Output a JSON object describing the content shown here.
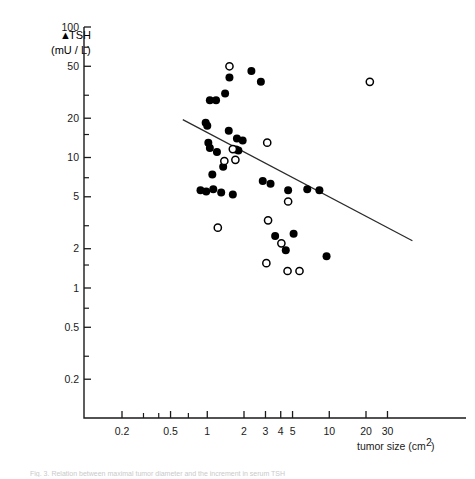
{
  "figure": {
    "caption": "Fig. 3. Relation between maximal tumor diameter and the increment in serum TSH",
    "x_axis_title": "tumor size (cm",
    "x_axis_title_sup": "2",
    "x_axis_title_end": ")",
    "y_axis_label_line1": "TSH",
    "y_axis_label_delta": "▲",
    "y_axis_label_line2": "(mU / L)"
  },
  "chart_data": {
    "type": "scatter",
    "title": "",
    "xlabel": "tumor size (cm2)",
    "ylabel": "ΔTSH (mU/L)",
    "xscale": "log",
    "yscale": "log",
    "xlim": [
      0.13,
      48
    ],
    "ylim": [
      0.16,
      100
    ],
    "grid": false,
    "legend": "none",
    "xticks": [
      0.2,
      0.5,
      1,
      2,
      3,
      4,
      5,
      10,
      20,
      30
    ],
    "xtick_labels": [
      "0.2",
      "0.5",
      "1",
      "2",
      "3",
      "4",
      "5",
      "10",
      "20",
      "30"
    ],
    "xticks_minor": [
      0.3,
      0.4,
      0.7
    ],
    "yticks": [
      0.2,
      0.5,
      1,
      2,
      5,
      10,
      20,
      50,
      100
    ],
    "ytick_labels": [
      "0.2",
      "0.5",
      "1",
      "2",
      "5",
      "10",
      "20",
      "50",
      "100"
    ],
    "yticks_minor": [
      0.3,
      0.7,
      1.5,
      3,
      7,
      15,
      30,
      70
    ],
    "series": [
      {
        "name": "filled",
        "marker": "filled-circle",
        "color": "#000000",
        "points": [
          [
            1.52,
            41.0
          ],
          [
            2.3,
            46.0
          ],
          [
            2.75,
            38.0
          ],
          [
            1.05,
            27.5
          ],
          [
            1.18,
            27.5
          ],
          [
            1.4,
            31.0
          ],
          [
            1.5,
            16.0
          ],
          [
            1.75,
            14.0
          ],
          [
            1.95,
            13.5
          ],
          [
            0.97,
            18.5
          ],
          [
            1.0,
            17.5
          ],
          [
            1.02,
            13.0
          ],
          [
            1.05,
            11.8
          ],
          [
            1.2,
            11.0
          ],
          [
            1.72,
            11.5
          ],
          [
            1.8,
            11.3
          ],
          [
            1.35,
            8.5
          ],
          [
            1.1,
            7.4
          ],
          [
            0.88,
            5.6
          ],
          [
            0.98,
            5.5
          ],
          [
            1.12,
            5.7
          ],
          [
            1.3,
            5.4
          ],
          [
            1.62,
            5.2
          ],
          [
            2.85,
            6.6
          ],
          [
            3.3,
            6.3
          ],
          [
            4.6,
            5.6
          ],
          [
            6.6,
            5.7
          ],
          [
            8.3,
            5.6
          ],
          [
            3.6,
            2.5
          ],
          [
            5.1,
            2.6
          ],
          [
            4.4,
            1.95
          ],
          [
            9.5,
            1.75
          ]
        ]
      },
      {
        "name": "open",
        "marker": "open-circle",
        "color": "#000000",
        "points": [
          [
            1.52,
            50.0
          ],
          [
            21.5,
            38.0
          ],
          [
            3.1,
            13.0
          ],
          [
            1.62,
            11.6
          ],
          [
            1.7,
            9.6
          ],
          [
            1.38,
            9.4
          ],
          [
            4.6,
            4.6
          ],
          [
            1.22,
            2.9
          ],
          [
            3.15,
            3.3
          ],
          [
            4.05,
            2.2
          ],
          [
            3.05,
            1.55
          ],
          [
            4.55,
            1.35
          ],
          [
            5.7,
            1.35
          ]
        ]
      }
    ],
    "regression_line": {
      "x_start": 0.63,
      "y_start": 19.5,
      "x_end": 48.0,
      "y_end": 2.3
    }
  }
}
